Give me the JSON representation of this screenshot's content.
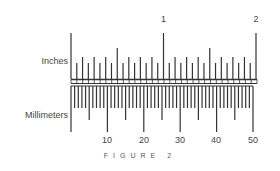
{
  "figure": {
    "caption": "F I G U R E   2",
    "caption_text": "FIGURE 2"
  },
  "inches_scale": {
    "label": "Inches",
    "unit": "in",
    "major_labels": [
      "1",
      "2"
    ],
    "range": [
      0,
      2
    ],
    "subdivision": 16,
    "color": "#333333"
  },
  "millimeters_scale": {
    "label": "Millimeters",
    "unit": "mm",
    "major_labels": [
      "10",
      "20",
      "30",
      "40",
      "50"
    ],
    "range": [
      0,
      50
    ],
    "subdivision": 1,
    "color": "#333333"
  }
}
